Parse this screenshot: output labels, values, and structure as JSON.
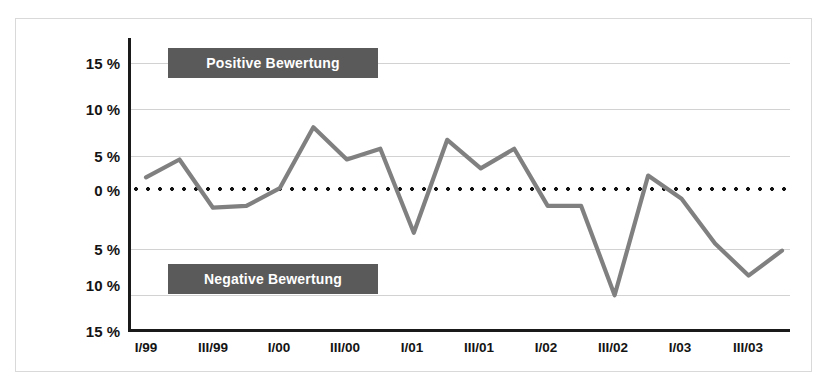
{
  "chart_data": {
    "type": "line",
    "title": "",
    "subtitle": "",
    "xlabel": "",
    "ylabel": "",
    "ylim": [
      -15,
      15
    ],
    "grid": true,
    "legend_position": "inside-plot",
    "ytick_labels": [
      "15 %",
      "10 %",
      "5 %",
      "0 %",
      "5 %",
      "10 %",
      "15 %"
    ],
    "ytick_values": [
      15,
      10,
      5,
      0,
      -5,
      -10,
      -15
    ],
    "xtick_labels": [
      "I/99",
      "III/99",
      "I/00",
      "III/00",
      "I/01",
      "III/01",
      "I/02",
      "III/02",
      "I/03",
      "III/03"
    ],
    "annotations": [
      {
        "text": "Positive Bewertung",
        "region": "upper"
      },
      {
        "text": "Negative Bewertung",
        "region": "lower"
      }
    ],
    "categories": [
      "I/99",
      "II/99",
      "III/99",
      "IV/99",
      "I/00",
      "II/00",
      "III/00",
      "IV/00",
      "I/01",
      "II/01",
      "III/01",
      "IV/01",
      "I/02",
      "II/02",
      "III/02",
      "IV/02",
      "I/03",
      "II/03",
      "III/03",
      "IV/03"
    ],
    "series": [
      {
        "name": "Saldo Bewertung",
        "color": "#808080",
        "values": [
          2.2,
          4.2,
          -1.2,
          -1.0,
          1.0,
          7.8,
          4.2,
          5.4,
          -4.0,
          6.4,
          3.2,
          5.4,
          -1.0,
          -1.0,
          -11.0,
          2.4,
          -0.2,
          -5.2,
          -8.8,
          -6.0
        ]
      }
    ],
    "zero_line": {
      "value": 0,
      "style": "dotted",
      "color": "#111111"
    }
  },
  "colors": {
    "series_line": "#808080",
    "legend_box": "#5a5a5a",
    "legend_text": "#ffffff",
    "gridline": "#d2d2d2",
    "axis": "#1a1a1a",
    "frame": "#d9d9d9",
    "background": "#ffffff",
    "tick_text": "#141414"
  }
}
